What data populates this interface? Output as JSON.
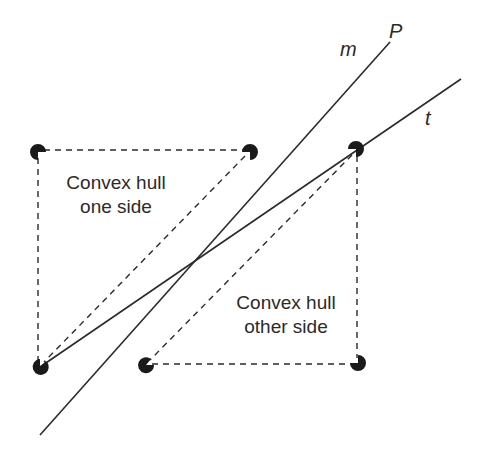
{
  "diagram": {
    "lines": {
      "m": {
        "label": "m",
        "end_label": "P",
        "from": [
          40,
          435
        ],
        "to": [
          390,
          42
        ]
      },
      "t": {
        "label": "t",
        "from": [
          40,
          367
        ],
        "to": [
          461,
          79
        ]
      }
    },
    "hull_one_side": {
      "label_line1": "Convex hull",
      "label_line2": "one side"
    },
    "hull_other_side": {
      "label_line1": "Convex hull",
      "label_line2": "other side"
    },
    "points": [
      {
        "id": "p1",
        "x": 38,
        "y": 152
      },
      {
        "id": "p2",
        "x": 250,
        "y": 152
      },
      {
        "id": "p3",
        "x": 356,
        "y": 149
      },
      {
        "id": "p4",
        "x": 40,
        "y": 367
      },
      {
        "id": "p5",
        "x": 146,
        "y": 365
      },
      {
        "id": "p6",
        "x": 358,
        "y": 363
      }
    ],
    "colors": {
      "ink": "#2a2a2a",
      "point": "#1a1a1a",
      "background": "#ffffff"
    }
  }
}
